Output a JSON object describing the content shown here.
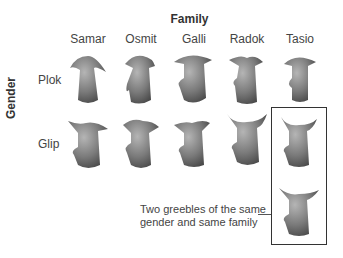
{
  "figure": {
    "title": "Family",
    "families": [
      "Samar",
      "Osmit",
      "Galli",
      "Radok",
      "Tasio"
    ],
    "gender_axis_label": "Gender",
    "genders": [
      "Plok",
      "Glip"
    ],
    "caption_line1": "Two greebles of the same",
    "caption_line2": "gender and same family",
    "highlight": {
      "family": "Tasio",
      "gender": "Glip",
      "count": 2
    },
    "colors": {
      "greeble_dark": "#5a5a5a",
      "greeble_light": "#a8a8a8",
      "frame": "#333333",
      "text": "#444444"
    }
  }
}
